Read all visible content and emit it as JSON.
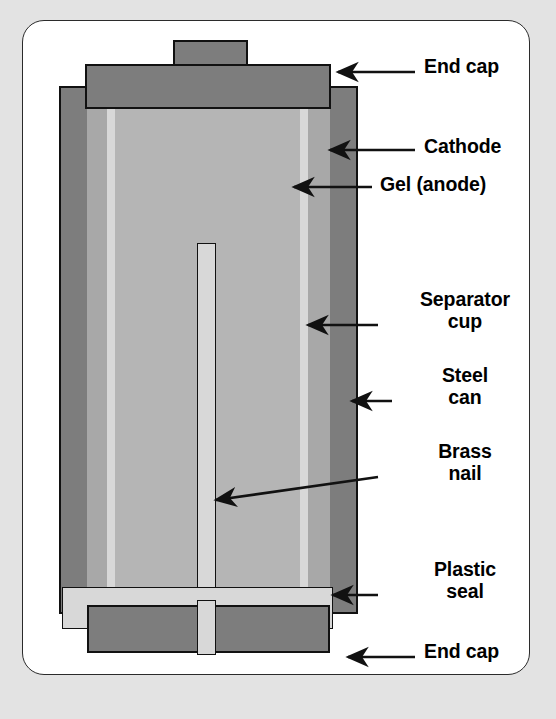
{
  "figure": {
    "type": "labeled-cross-section",
    "background_color": "#e3e3e3",
    "panel_color": "#ffffff",
    "line_color": "#111111"
  },
  "palette": {
    "end_cap": "#7d7d7d",
    "steel_can": "#7d7d7d",
    "cathode": "#a8a8a8",
    "gel_anode": "#b5b5b5",
    "separator_cup": "#d8d8d8",
    "plastic_seal": "#d8d8d8",
    "brass_nail": "#d8d8d8"
  },
  "labels": [
    {
      "id": "end-cap-top",
      "text": "End cap",
      "lines": [
        "End cap"
      ],
      "align": "left",
      "x": 424,
      "y": 56,
      "width": 120
    },
    {
      "id": "cathode",
      "text": "Cathode",
      "lines": [
        "Cathode"
      ],
      "align": "left",
      "x": 424,
      "y": 126,
      "width": 120
    },
    {
      "id": "gel-anode",
      "text": "Gel (anode)",
      "lines": [
        "Gel (anode)"
      ],
      "align": "left",
      "x": 380,
      "y": 174,
      "width": 170
    },
    {
      "id": "separator-cup",
      "text": "Separator cup",
      "lines": [
        "Separator",
        "cup"
      ],
      "align": "center",
      "x": 382,
      "y": 287,
      "width": 166
    },
    {
      "id": "steel-can",
      "text": "Steel can",
      "lines": [
        "Steel",
        "can"
      ],
      "align": "center",
      "x": 382,
      "y": 373,
      "width": 166
    },
    {
      "id": "brass-nail",
      "text": "Brass nail",
      "lines": [
        "Brass",
        "nail"
      ],
      "align": "center",
      "x": 382,
      "y": 462,
      "width": 166
    },
    {
      "id": "plastic-seal",
      "text": "Plastic seal",
      "lines": [
        "Plastic",
        "seal"
      ],
      "align": "center",
      "x": 382,
      "y": 551,
      "width": 166
    },
    {
      "id": "end-cap-bottom",
      "text": "End cap",
      "lines": [
        "End cap"
      ],
      "align": "left",
      "x": 424,
      "y": 641,
      "width": 120
    }
  ],
  "leaders": [
    {
      "id": "leader-end-cap-top",
      "from": [
        415,
        72
      ],
      "to": [
        335,
        72
      ],
      "arrow": true
    },
    {
      "id": "leader-cathode",
      "from": [
        415,
        150
      ],
      "to": [
        327,
        150
      ],
      "arrow": true
    },
    {
      "id": "leader-gel-anode",
      "from": [
        372,
        187
      ],
      "to": [
        291,
        187
      ],
      "arrow": true
    },
    {
      "id": "leader-separator-cup",
      "from": [
        378,
        325
      ],
      "to": [
        305,
        325
      ],
      "arrow": true
    },
    {
      "id": "leader-steel-can",
      "from": [
        380,
        401
      ],
      "to": [
        350,
        401
      ],
      "arrow": true
    },
    {
      "id": "leader-brass-nail",
      "from": [
        378,
        477
      ],
      "to": [
        213,
        500
      ],
      "arrow": true
    },
    {
      "id": "leader-plastic-seal",
      "from": [
        378,
        595
      ],
      "to": [
        330,
        595
      ],
      "arrow": true
    },
    {
      "id": "leader-end-cap-bottom",
      "from": [
        415,
        657
      ],
      "to": [
        345,
        657
      ],
      "arrow": true
    }
  ],
  "parts": [
    {
      "id": "top-terminal-nub",
      "name": "top-terminal-nub",
      "fill": "#7d7d7d",
      "x": 173,
      "y": 40,
      "w": 75,
      "h": 25
    },
    {
      "id": "top-end-cap",
      "name": "top-end-cap",
      "fill": "#7d7d7d",
      "x": 85,
      "y": 64,
      "w": 246,
      "h": 45
    },
    {
      "id": "steel-can",
      "name": "steel-can",
      "fill": "#7d7d7d",
      "x": 59,
      "y": 86,
      "w": 299,
      "h": 528
    },
    {
      "id": "cathode",
      "name": "cathode",
      "fill": "#a8a8a8",
      "x": 87,
      "y": 108,
      "w": 243,
      "h": 480
    },
    {
      "id": "separator-left",
      "name": "separator-cup-left",
      "fill": "#d8d8d8",
      "x": 107,
      "y": 108,
      "w": 8,
      "h": 480
    },
    {
      "id": "separator-right",
      "name": "separator-cup-right",
      "fill": "#d8d8d8",
      "x": 300,
      "y": 108,
      "w": 8,
      "h": 480
    },
    {
      "id": "gel-anode",
      "name": "gel-anode",
      "fill": "#b5b5b5",
      "x": 115,
      "y": 108,
      "w": 185,
      "h": 480
    },
    {
      "id": "brass-nail",
      "name": "brass-nail",
      "fill": "#d8d8d8",
      "x": 197,
      "y": 243,
      "w": 19,
      "h": 412
    },
    {
      "id": "plastic-seal",
      "name": "plastic-seal",
      "fill": "#d8d8d8",
      "x": 62,
      "y": 587,
      "w": 271,
      "h": 42
    },
    {
      "id": "bottom-end-cap",
      "name": "bottom-end-cap",
      "fill": "#7d7d7d",
      "x": 87,
      "y": 605,
      "w": 243,
      "h": 48
    }
  ]
}
